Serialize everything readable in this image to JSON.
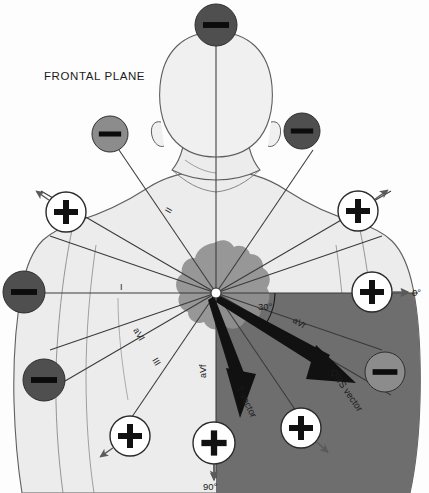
{
  "figure": {
    "title": "FRONTAL PLANE",
    "background_color": "#fdfdfd"
  },
  "colors": {
    "body_fill": "#ececec",
    "body_stroke": "#5f5f5f",
    "heart_fill": "#8f8f8f",
    "shaded_quadrant": "#6e6e6e",
    "axis_line": "#3a3a3a",
    "negative_pole_dark": "#4f4f4f",
    "negative_pole_mid": "#8c8c8c",
    "positive_pole_fill": "#ffffff",
    "positive_pole_stroke": "#2b2b2b",
    "vector_arrow": "#111111",
    "label_text": "#1b1b1b"
  },
  "origin": {
    "x": 216,
    "y": 293,
    "radius": 5,
    "label": "heart-center-origin"
  },
  "axis_reference": {
    "zero_degree_label": "0°",
    "ninety_degree_label": "90°",
    "qrs_angle_label": "30°"
  },
  "lead_axis_labels": [
    {
      "id": "lead-I",
      "text": "I",
      "x": 120,
      "y": 290,
      "rotate": 0
    },
    {
      "id": "lead-II",
      "text": "II",
      "x": 170,
      "y": 214,
      "rotate": -60
    },
    {
      "id": "lead-III",
      "text": "III",
      "x": 152,
      "y": 360,
      "rotate": 60
    },
    {
      "id": "lead-aVL",
      "text": "aVl",
      "x": 133,
      "y": 330,
      "rotate": 60
    },
    {
      "id": "lead-aVR",
      "text": "aVr",
      "x": 292,
      "y": 322,
      "rotate": 30
    },
    {
      "id": "lead-aVF",
      "text": "aVf",
      "x": 206,
      "y": 378,
      "rotate": -90
    }
  ],
  "vectors": [
    {
      "id": "qrs-vector",
      "label": "QRS vector",
      "angle_deg": 30,
      "label_x": 330,
      "label_y": 372,
      "label_rotate": 55
    },
    {
      "id": "t-vector",
      "label": "T vector",
      "angle_deg": 62,
      "label_x": 236,
      "label_y": 388,
      "label_rotate": 63
    }
  ],
  "poles": [
    {
      "id": "pole-superior-negative",
      "sign": "−",
      "type": "negative",
      "shade": "dark",
      "cx": 216,
      "cy": 25,
      "r": 21
    },
    {
      "id": "pole-upper-left-negative",
      "sign": "−",
      "type": "negative",
      "shade": "mid",
      "cx": 110,
      "cy": 134,
      "r": 18
    },
    {
      "id": "pole-upper-right-negative",
      "sign": "−",
      "type": "negative",
      "shade": "dark",
      "cx": 302,
      "cy": 131,
      "r": 18
    },
    {
      "id": "pole-left-lateral-negative",
      "sign": "−",
      "type": "negative",
      "shade": "dark",
      "cx": 24,
      "cy": 292,
      "r": 21
    },
    {
      "id": "pole-lower-left-negative",
      "sign": "−",
      "type": "negative",
      "shade": "dark",
      "cx": 44,
      "cy": 380,
      "r": 21
    },
    {
      "id": "pole-lower-right-negative",
      "sign": "−",
      "type": "negative",
      "shade": "mid",
      "cx": 385,
      "cy": 372,
      "r": 20
    },
    {
      "id": "pole-upper-left-positive",
      "sign": "+",
      "type": "positive",
      "cx": 66,
      "cy": 212,
      "r": 20,
      "arrow_deg": 215
    },
    {
      "id": "pole-upper-right-positive",
      "sign": "+",
      "type": "positive",
      "cx": 358,
      "cy": 211,
      "r": 20,
      "arrow_deg": -35
    },
    {
      "id": "pole-right-lateral-positive",
      "sign": "+",
      "type": "positive",
      "cx": 372,
      "cy": 292,
      "r": 20,
      "arrow_deg": 0
    },
    {
      "id": "pole-lower-left-positive",
      "sign": "+",
      "type": "positive",
      "cx": 130,
      "cy": 436,
      "r": 20,
      "arrow_deg": 145
    },
    {
      "id": "pole-inferior-positive",
      "sign": "+",
      "type": "positive",
      "cx": 214,
      "cy": 443,
      "r": 21,
      "arrow_deg": 90
    },
    {
      "id": "pole-lower-right-positive",
      "sign": "+",
      "type": "positive",
      "cx": 301,
      "cy": 428,
      "r": 20,
      "arrow_deg": 42
    }
  ]
}
